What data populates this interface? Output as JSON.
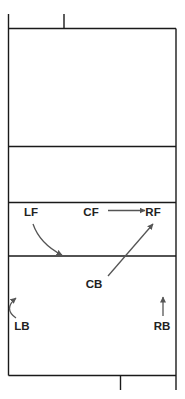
{
  "diagram": {
    "type": "volleyball-court-rotation",
    "colors": {
      "line": "#1a1a1a",
      "arrow": "#555555",
      "label": "#222222",
      "background": "#ffffff"
    },
    "positions": {
      "LF": {
        "label": "LF",
        "x": 31,
        "y": 216
      },
      "CF": {
        "label": "CF",
        "x": 91,
        "y": 216
      },
      "RF": {
        "label": "RF",
        "x": 153,
        "y": 216
      },
      "CB": {
        "label": "CB",
        "x": 94,
        "y": 288
      },
      "LB": {
        "label": "LB",
        "x": 22,
        "y": 330
      },
      "RB": {
        "label": "RB",
        "x": 162,
        "y": 330
      }
    },
    "movements": [
      {
        "from": "LF",
        "to": "center-line area",
        "shape": "curve"
      },
      {
        "from": "CF",
        "to": "RF",
        "shape": "straight"
      },
      {
        "from": "CB",
        "to": "RF",
        "shape": "straight"
      },
      {
        "from": "LB",
        "to": "up-left",
        "shape": "curve"
      },
      {
        "from": "RB",
        "to": "up",
        "shape": "straight"
      }
    ]
  }
}
